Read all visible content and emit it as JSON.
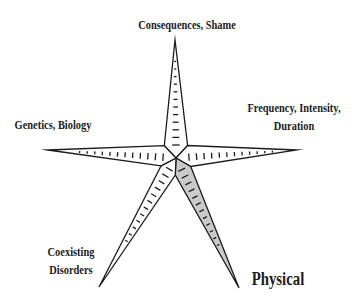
{
  "diagram": {
    "type": "star-axes-diagram",
    "background_color": "#ffffff",
    "line_color": "#1c1c1c",
    "shaded_fill_color": "#cacaca",
    "unshaded_fill_color": "#ffffff",
    "center": {
      "x": 176,
      "y": 158
    },
    "geometry": {
      "base_half_width": 9,
      "notch_radius": 17,
      "outline_width": 1.3,
      "tick_width": 1.3,
      "tick_start": 13,
      "tick_spacing": 7.6,
      "ticks_per_arm": 12
    },
    "arms": [
      {
        "id": "consequences-shame",
        "shaded": false,
        "tip": {
          "x": 175,
          "y": 40
        },
        "label": {
          "text": "Consequences, Shame",
          "x": 187,
          "y": 16,
          "font_size": 13
        }
      },
      {
        "id": "frequency-intensity-duration",
        "shaded": false,
        "tip": {
          "x": 297,
          "y": 150
        },
        "label": {
          "text": "Frequency, Intensity,\nDuration",
          "x": 294,
          "y": 99,
          "font_size": 13
        }
      },
      {
        "id": "physical",
        "shaded": true,
        "tip": {
          "x": 239,
          "y": 288
        },
        "label": {
          "text": "Physical",
          "x": 278,
          "y": 266,
          "font_size": 18.5
        }
      },
      {
        "id": "coexisting-disorders",
        "shaded": false,
        "tip": {
          "x": 99,
          "y": 287
        },
        "label": {
          "text": "Coexisting\nDisorders",
          "x": 71,
          "y": 243,
          "font_size": 13
        }
      },
      {
        "id": "genetics-biology",
        "shaded": false,
        "tip": {
          "x": 48,
          "y": 150
        },
        "label": {
          "text": "Genetics, Biology",
          "x": 53,
          "y": 116,
          "font_size": 13
        }
      }
    ]
  }
}
